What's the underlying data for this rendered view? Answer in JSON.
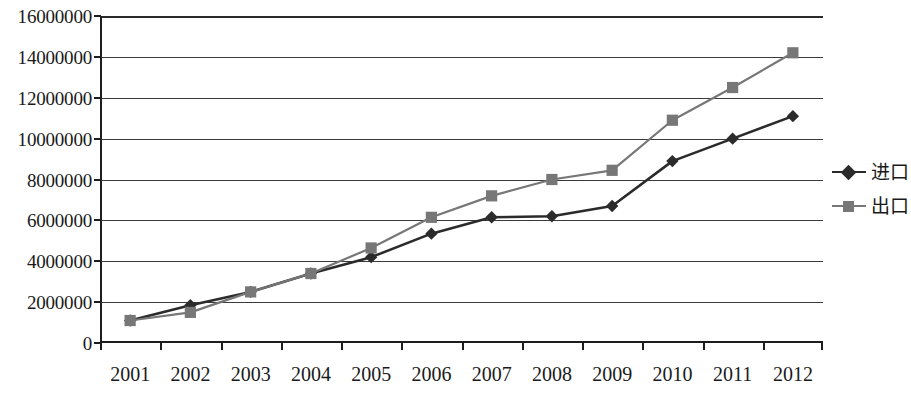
{
  "chart_data": {
    "type": "line",
    "title": "",
    "xlabel": "",
    "ylabel": "",
    "categories": [
      "2001",
      "2002",
      "2003",
      "2004",
      "2005",
      "2006",
      "2007",
      "2008",
      "2009",
      "2010",
      "2011",
      "2012"
    ],
    "series": [
      {
        "name": "进口",
        "marker": "diamond",
        "color": "#2b2b2b",
        "values": [
          1100000,
          1850000,
          2500000,
          3400000,
          4200000,
          5350000,
          6150000,
          6200000,
          6700000,
          8900000,
          10000000,
          11100000
        ]
      },
      {
        "name": "出口",
        "marker": "square",
        "color": "#777777",
        "values": [
          1100000,
          1500000,
          2500000,
          3400000,
          4650000,
          6150000,
          7200000,
          8000000,
          8450000,
          10900000,
          12500000,
          14200000
        ]
      }
    ],
    "ylim": [
      0,
      16000000
    ],
    "ytick_values": [
      0,
      2000000,
      4000000,
      6000000,
      8000000,
      10000000,
      12000000,
      14000000,
      16000000
    ],
    "ytick_labels": [
      "0",
      "2000000",
      "4000000",
      "6000000",
      "8000000",
      "10000000",
      "12000000",
      "14000000",
      "16000000"
    ],
    "grid": true,
    "legend_position": "right"
  },
  "legend": {
    "items": [
      {
        "label": "进口"
      },
      {
        "label": "出口"
      }
    ]
  }
}
